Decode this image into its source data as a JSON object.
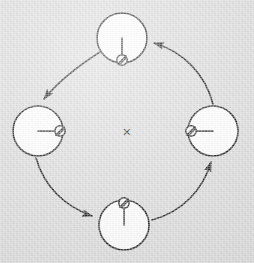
{
  "figure": {
    "kind": "cyclic-spin-precession-diagram",
    "background_color": "#d7d7d7",
    "ink_color": "#1a1a1a",
    "node_fill_color": "#fbfbfb",
    "width": 254,
    "height": 263
  },
  "center_marker": {
    "name": "center-cross",
    "glyph": "×",
    "label": "",
    "x": 127,
    "y": 131,
    "size": 15
  },
  "nodes": [
    {
      "id": "node-top",
      "position": "top",
      "cx": 122,
      "cy": 38,
      "r": 25,
      "needle_direction": "down",
      "needle_angle_deg": 90,
      "needle_length": 22,
      "tip_marker": "slashed-disc",
      "tip_r": 5.2,
      "label": ""
    },
    {
      "id": "node-left",
      "position": "left",
      "cx": 38,
      "cy": 131,
      "r": 25,
      "needle_direction": "right",
      "needle_angle_deg": 0,
      "needle_length": 22,
      "tip_marker": "slashed-disc",
      "tip_r": 5.2,
      "label": ""
    },
    {
      "id": "node-bottom",
      "position": "bottom",
      "cx": 124,
      "cy": 225,
      "r": 25,
      "needle_direction": "up",
      "needle_angle_deg": 270,
      "needle_length": 22,
      "tip_marker": "slashed-disc",
      "tip_r": 5.2,
      "label": ""
    },
    {
      "id": "node-right",
      "position": "right",
      "cx": 213,
      "cy": 131,
      "r": 25,
      "needle_direction": "left",
      "needle_angle_deg": 180,
      "needle_length": 22,
      "tip_marker": "slashed-disc",
      "tip_r": 5.2,
      "label": ""
    }
  ],
  "arrows": [
    {
      "id": "arrow-top-to-left",
      "from": "node-top",
      "to": "node-left",
      "label": "",
      "path": "M 100 52 C 78 66 58 82 44 99",
      "head_angle_deg": 128
    },
    {
      "id": "arrow-left-to-bottom",
      "from": "node-left",
      "to": "node-bottom",
      "label": "",
      "path": "M 36 158 C 44 186 64 206 92 216",
      "head_angle_deg": 17
    },
    {
      "id": "arrow-bottom-to-right",
      "from": "node-bottom",
      "to": "node-right",
      "label": "",
      "path": "M 152 220 C 182 212 203 190 211 162",
      "head_angle_deg": -70
    },
    {
      "id": "arrow-right-to-top",
      "from": "node-right",
      "to": "node-top",
      "label": "",
      "path": "M 213 104 C 205 74 184 52 154 43",
      "head_angle_deg": 197
    }
  ]
}
